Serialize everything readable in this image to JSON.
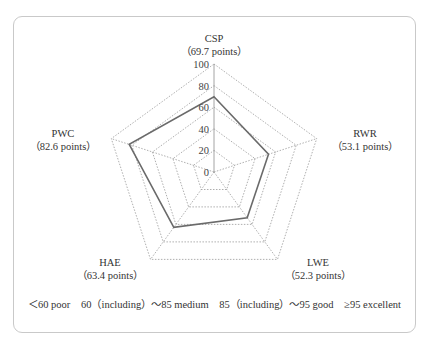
{
  "chart_data": {
    "type": "radar",
    "title": "",
    "axes": [
      "CSP",
      "RWR",
      "LWE",
      "HAE",
      "PWC"
    ],
    "values": [
      69.7,
      53.1,
      52.3,
      63.4,
      82.6
    ],
    "value_labels": [
      "（69.7 points）",
      "（53.1 points）",
      "（52.3 points）",
      "（63.4 points）",
      "（82.6 points）"
    ],
    "range": [
      0,
      100
    ],
    "ticks": [
      0,
      20,
      40,
      60,
      80,
      100
    ],
    "grid": "dotted pentagons",
    "legend_position": "bottom",
    "legend": [
      "＜60 poor",
      "60（including）～85 medium",
      "85（including）～95 good",
      "≥95 excellent"
    ]
  },
  "colors": {
    "series_line": "#6a6a6a",
    "grid_line": "#9a9a9a",
    "frame_border": "#c9c9c9"
  },
  "labels": {
    "csp": {
      "name": "CSP",
      "score": "（69.7 points）"
    },
    "rwr": {
      "name": "RWR",
      "score": "（53.1 points）"
    },
    "lwe": {
      "name": "LWE",
      "score": "（52.3 points）"
    },
    "hae": {
      "name": "HAE",
      "score": "（63.4 points）"
    },
    "pwc": {
      "name": "PWC",
      "score": "（82.6 points）"
    }
  },
  "legend": {
    "poor": "＜60 poor",
    "medium": "60（including）～85 medium",
    "good": "85（including）～95 good",
    "excellent": "≥95 excellent"
  }
}
